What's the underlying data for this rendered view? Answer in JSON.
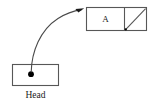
{
  "diagram": {
    "type": "linked-list",
    "title": "",
    "background_color": "#ffffff",
    "stroke_color": "#575757",
    "text_color": "#1a1a1a",
    "head_pointer": {
      "label": "Head",
      "icon": "pointer-dot-icon",
      "box": {
        "x": 12,
        "y": 64,
        "width": 47,
        "height": 22
      },
      "dot": {
        "cx": 31,
        "cy": 74,
        "r": 2.8
      }
    },
    "node": {
      "value": "A",
      "next_field": {
        "icon": "null-pointer-slash-icon",
        "is_null": true
      },
      "box": {
        "x": 86,
        "y": 7,
        "width": 61,
        "height": 24
      },
      "divider_x": 124
    },
    "link": {
      "icon": "curved-arrow-icon",
      "from": "head_pointer.dot",
      "to": "node.box.top_left",
      "arrowhead": {
        "x": 84,
        "y": 9
      }
    }
  }
}
